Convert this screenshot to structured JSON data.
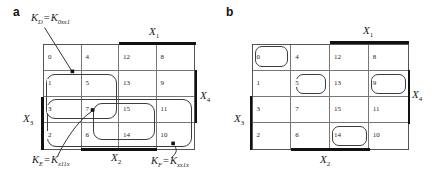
{
  "panels": {
    "a": {
      "panel_label": "a",
      "cells": [
        [
          "0",
          "4",
          "12",
          "8"
        ],
        [
          "1",
          "5",
          "13",
          "9"
        ],
        [
          "3",
          "7",
          "15",
          "11"
        ],
        [
          "2",
          "6",
          "14",
          "10"
        ]
      ],
      "axes": {
        "top": {
          "base": "X",
          "sub": "1"
        },
        "right": {
          "base": "X",
          "sub": "4"
        },
        "left": {
          "base": "X",
          "sub": "3"
        },
        "bottom": {
          "base": "X",
          "sub": "2"
        }
      },
      "annotations": {
        "kd": {
          "lhs_base": "K",
          "lhs_sub": "D",
          "eq": "=",
          "rhs_base": "K",
          "rhs_sub": "0xx1"
        },
        "ke": {
          "lhs_base": "K",
          "lhs_sub": "E",
          "eq": "=",
          "rhs_base": "K",
          "rhs_sub": "x11x"
        },
        "kf": {
          "lhs_base": "K",
          "lhs_sub": "F",
          "eq": "=",
          "rhs_base": "K",
          "rhs_sub": "xx1x"
        }
      },
      "loops": [
        {
          "name": "loop-kd",
          "cells": "1,5,3,7"
        },
        {
          "name": "loop-ke",
          "cells": "7,15,6,14"
        },
        {
          "name": "loop-kf",
          "cells": "3,7,15,11,2,6,14,10"
        }
      ]
    },
    "b": {
      "panel_label": "b",
      "cells": [
        [
          "0",
          "4",
          "12",
          "8"
        ],
        [
          "1",
          "5",
          "13",
          "9"
        ],
        [
          "3",
          "7",
          "15",
          "11"
        ],
        [
          "2",
          "6",
          "14",
          "10"
        ]
      ],
      "axes": {
        "top": {
          "base": "X",
          "sub": "1"
        },
        "right": {
          "base": "X",
          "sub": "4"
        },
        "left": {
          "base": "X",
          "sub": "3"
        },
        "bottom": {
          "base": "X",
          "sub": "2"
        }
      },
      "loops": [
        {
          "name": "loop-cell-0",
          "cells": "0"
        },
        {
          "name": "loop-cell-5",
          "cells": "5"
        },
        {
          "name": "loop-cell-9",
          "cells": "9"
        },
        {
          "name": "loop-cell-14",
          "cells": "14"
        }
      ]
    }
  }
}
